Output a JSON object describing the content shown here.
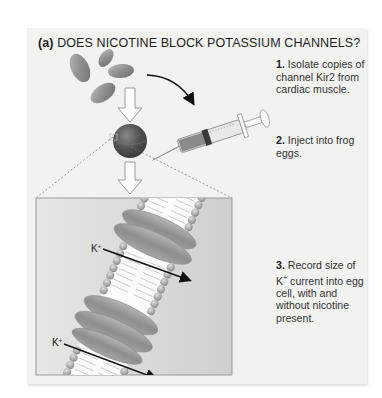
{
  "figure": {
    "label": "(a)",
    "title": "DOES NICOTINE BLOCK POTASSIUM CHANNELS?"
  },
  "steps": [
    {
      "number": "1.",
      "text": "Isolate copies of channel Kir2 from cardiac muscle."
    },
    {
      "number": "2.",
      "text": "Inject into frog eggs."
    },
    {
      "number": "3.",
      "text_before": "Record size of K",
      "superscript": "+",
      "text_after": " current into egg cell, with and without nicotine present."
    }
  ],
  "labels": {
    "ion_top": "K",
    "ion_bottom": "K",
    "ion_charge": "+"
  },
  "illustration": {
    "elements": [
      "channel-protein-blobs",
      "down-arrow",
      "curved-arrow",
      "syringe",
      "frog-egg",
      "down-arrow",
      "zoom-lines",
      "membrane-closeup",
      "k-ion-arrows"
    ]
  },
  "colors": {
    "panel_bg": "#f2f2f1",
    "protein_gray": "#9a9a98",
    "egg_dark": "#555555",
    "membrane_bg": "#dcdcda",
    "text": "#222222"
  }
}
